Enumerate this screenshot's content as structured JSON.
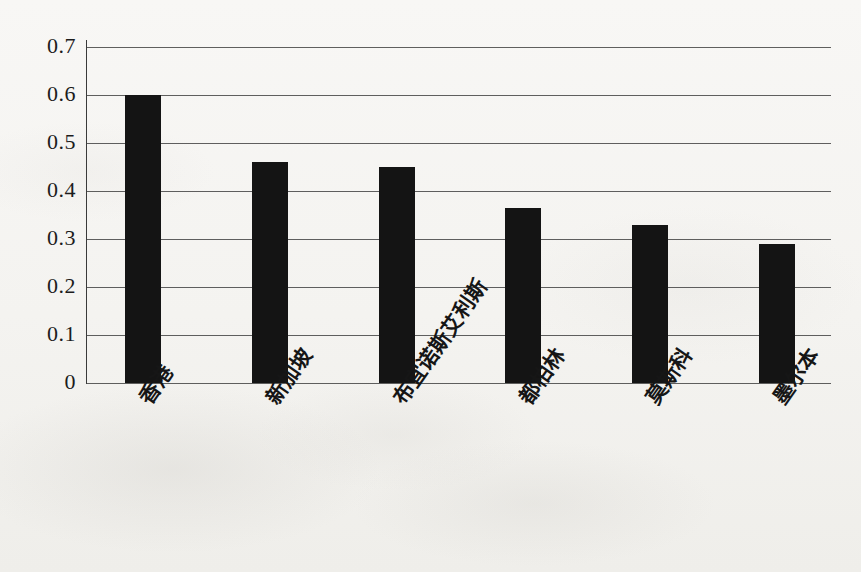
{
  "chart_data": {
    "type": "bar",
    "title": "",
    "subtitle": "",
    "xlabel": "",
    "ylabel": "",
    "categories": [
      "香港",
      "新加坡",
      "布宜诺斯艾利斯",
      "都柏林",
      "莫斯科",
      "墨尔本"
    ],
    "values": [
      0.6,
      0.46,
      0.45,
      0.365,
      0.33,
      0.29
    ],
    "ylim": [
      0,
      0.7
    ],
    "ytick_labels": [
      "0.7",
      "0.6",
      "0.5",
      "0.4",
      "0.3",
      "0.2",
      "0.1",
      "0"
    ],
    "ytick_values": [
      0.7,
      0.6,
      0.5,
      0.4,
      0.3,
      0.2,
      0.1,
      0
    ],
    "grid": true,
    "grid_axis": "y",
    "legend": false,
    "legend_position": "none",
    "bar_color": "#141414",
    "background_color": "#f6f5f3",
    "axis_color": "#3a3a3a",
    "label_rotation_deg": -55
  },
  "axes": {
    "y_ticks": [
      {
        "label": "0.7",
        "value": 0.7
      },
      {
        "label": "0.6",
        "value": 0.6
      },
      {
        "label": "0.5",
        "value": 0.5
      },
      {
        "label": "0.4",
        "value": 0.4
      },
      {
        "label": "0.3",
        "value": 0.3
      },
      {
        "label": "0.2",
        "value": 0.2
      },
      {
        "label": "0.1",
        "value": 0.1
      },
      {
        "label": "0",
        "value": 0
      }
    ],
    "x_ticks": [
      {
        "label": "香港",
        "value": 0.6
      },
      {
        "label": "新加坡",
        "value": 0.46
      },
      {
        "label": "布宜诺斯艾利斯",
        "value": 0.45
      },
      {
        "label": "都柏林",
        "value": 0.365
      },
      {
        "label": "莫斯科",
        "value": 0.33
      },
      {
        "label": "墨尔本",
        "value": 0.29
      }
    ]
  }
}
